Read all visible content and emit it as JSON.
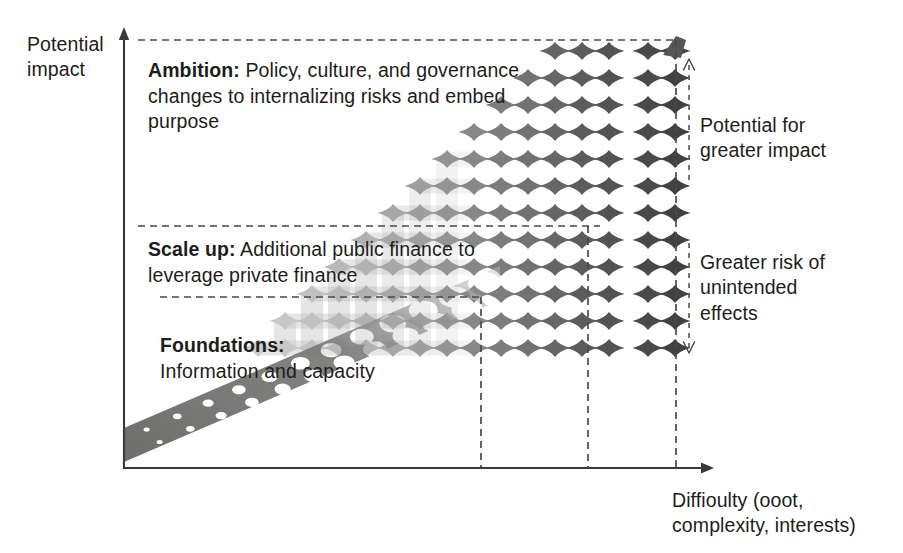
{
  "figure": {
    "type": "conceptual-diagram",
    "axes": {
      "y_label": "Potential\nimpact",
      "x_label": "Diffioulty (ooot,\ncomplexity, interests)"
    },
    "bands": [
      {
        "id": "ambition",
        "title": "Ambition:",
        "body": " Policy, culture, and governance changes to internalizing risks and embed purpose"
      },
      {
        "id": "scale-up",
        "title": "Scale up:",
        "body": " Additional public finance to leverage private finance"
      },
      {
        "id": "foundations",
        "title": "Foundations:",
        "body": "\nInformation and capacity"
      }
    ],
    "annotations": [
      {
        "id": "potential-for-greater-impact",
        "text": "Potential for\ngreater impact",
        "direction": "up"
      },
      {
        "id": "greater-risk-unintended",
        "text": "Greater risk of\nunintended\neffects",
        "direction": "down"
      }
    ],
    "colors": {
      "ink": "#1d1d1b",
      "axis": "#3a3a38",
      "dash": "#4a4a48",
      "ramp_dark": "#6d6d6b",
      "lattice_light": "#d9d9d9",
      "lattice_dark": "#5e5e5e"
    }
  },
  "chart_data": {
    "type": "scatter",
    "title": "",
    "xlabel": "Diffioulty (ooot, complexity, interests)",
    "ylabel": "Potential impact",
    "grid": false,
    "legend": "none",
    "series": [
      {
        "name": "lattice",
        "comment": "columns of diamond markers: x position index, count of markers, darkness 0..1",
        "columns": [
          {
            "x": 258,
            "n": 1,
            "shade": 0.12
          },
          {
            "x": 285,
            "n": 2,
            "shade": 0.16
          },
          {
            "x": 312,
            "n": 3,
            "shade": 0.2
          },
          {
            "x": 339,
            "n": 4,
            "shade": 0.25
          },
          {
            "x": 366,
            "n": 5,
            "shade": 0.3
          },
          {
            "x": 393,
            "n": 6,
            "shade": 0.36
          },
          {
            "x": 420,
            "n": 7,
            "shade": 0.42
          },
          {
            "x": 447,
            "n": 8,
            "shade": 0.49
          },
          {
            "x": 474,
            "n": 9,
            "shade": 0.56
          },
          {
            "x": 501,
            "n": 10,
            "shade": 0.63
          },
          {
            "x": 528,
            "n": 11,
            "shade": 0.7
          },
          {
            "x": 555,
            "n": 12,
            "shade": 0.77
          },
          {
            "x": 582,
            "n": 12,
            "shade": 0.83
          },
          {
            "x": 609,
            "n": 13,
            "shade": 0.89
          },
          {
            "x": 648,
            "n": 13,
            "shade": 0.95
          },
          {
            "x": 675,
            "n": 14,
            "shade": 1.0
          }
        ]
      },
      {
        "name": "foundations-ramp",
        "comment": "dark diagonal perforated band from lower-left to mid-right",
        "x_start": 124,
        "y_start": 462,
        "x_end": 500,
        "y_end": 300
      }
    ],
    "dashed_guides": {
      "horizontal": [
        {
          "id": "ambition-top",
          "y": 40,
          "x1": 138,
          "x2": 678
        },
        {
          "id": "scaleup-top",
          "y": 226,
          "x1": 138,
          "x2": 600
        },
        {
          "id": "foundations-top",
          "y": 297,
          "x1": 160,
          "x2": 481
        }
      ],
      "vertical": [
        {
          "id": "v-foundations",
          "x": 481,
          "y1": 297,
          "y2": 468
        },
        {
          "id": "v-scaleup",
          "x": 588,
          "y1": 226,
          "y2": 468
        },
        {
          "id": "v-ambition",
          "x": 676,
          "y1": 40,
          "y2": 468
        }
      ]
    },
    "axis_lines": {
      "y_axis": {
        "x": 124,
        "y_bottom": 468,
        "y_top": 30,
        "arrow": "up"
      },
      "x_axis": {
        "y": 468,
        "x_left": 124,
        "x_right": 712,
        "arrow": "right"
      }
    }
  }
}
